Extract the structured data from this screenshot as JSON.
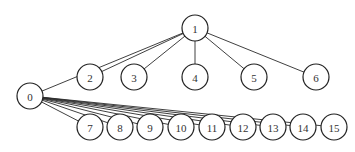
{
  "diagram": {
    "type": "tree",
    "nodes": [
      {
        "id": "1",
        "label": "1",
        "x": 195,
        "y": 28
      },
      {
        "id": "0",
        "label": "0",
        "x": 30,
        "y": 96
      },
      {
        "id": "2",
        "label": "2",
        "x": 90,
        "y": 77
      },
      {
        "id": "3",
        "label": "3",
        "x": 134,
        "y": 77
      },
      {
        "id": "4",
        "label": "4",
        "x": 195,
        "y": 77
      },
      {
        "id": "5",
        "label": "5",
        "x": 254,
        "y": 77
      },
      {
        "id": "6",
        "label": "6",
        "x": 316,
        "y": 77
      },
      {
        "id": "7",
        "label": "7",
        "x": 90,
        "y": 127
      },
      {
        "id": "8",
        "label": "8",
        "x": 120,
        "y": 127
      },
      {
        "id": "9",
        "label": "9",
        "x": 150,
        "y": 127
      },
      {
        "id": "10",
        "label": "10",
        "x": 181,
        "y": 127
      },
      {
        "id": "11",
        "label": "11",
        "x": 212,
        "y": 127
      },
      {
        "id": "12",
        "label": "12",
        "x": 243,
        "y": 127
      },
      {
        "id": "13",
        "label": "13",
        "x": 273,
        "y": 127
      },
      {
        "id": "14",
        "label": "14",
        "x": 303,
        "y": 127
      },
      {
        "id": "15",
        "label": "15",
        "x": 334,
        "y": 127
      }
    ],
    "edges": [
      [
        "1",
        "0"
      ],
      [
        "1",
        "2"
      ],
      [
        "1",
        "3"
      ],
      [
        "1",
        "4"
      ],
      [
        "1",
        "5"
      ],
      [
        "1",
        "6"
      ],
      [
        "0",
        "7"
      ],
      [
        "0",
        "8"
      ],
      [
        "0",
        "9"
      ],
      [
        "0",
        "10"
      ],
      [
        "0",
        "11"
      ],
      [
        "0",
        "12"
      ],
      [
        "0",
        "13"
      ],
      [
        "0",
        "14"
      ],
      [
        "0",
        "15"
      ]
    ],
    "node_radius": 13
  }
}
